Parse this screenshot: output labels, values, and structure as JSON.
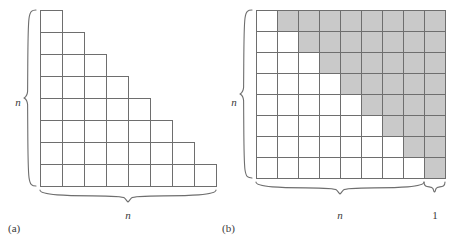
{
  "figure": {
    "background_color": "#ffffff",
    "grid_line_color": "#6e6e6e",
    "shaded_cell_color": "#c9c9c9",
    "white_cell_color": "#ffffff",
    "text_color": "#3a3a3a"
  },
  "panel_a": {
    "caption": "(a)",
    "left_brace_label": "n",
    "bottom_brace_label": "n",
    "rows": 8,
    "cols": 8,
    "shape": "staircase",
    "row_cell_counts": [
      1,
      2,
      3,
      4,
      5,
      6,
      7,
      8
    ],
    "cell_size": 22,
    "origin_x": 40,
    "origin_y": 10
  },
  "panel_b": {
    "caption": "(b)",
    "left_brace_label": "n",
    "bottom_brace_label": "n",
    "bottom_extra_brace_label": "1",
    "rows": 8,
    "cols": 9,
    "shape": "full-grid-with-shaded-complement",
    "row_white_counts": [
      1,
      2,
      3,
      4,
      5,
      6,
      7,
      8
    ],
    "cell_size": 21,
    "origin_x": 256,
    "origin_y": 10,
    "bottom_brace_cols": 8,
    "bottom_extra_brace_cols": 1
  }
}
